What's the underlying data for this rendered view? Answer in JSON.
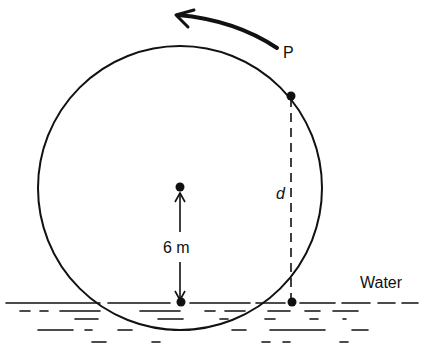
{
  "diagram": {
    "labels": {
      "point": "P",
      "distance": "d",
      "radius": "6 m",
      "water": "Water"
    },
    "rotation_direction": "counterclockwise",
    "colors": {
      "ink": "#111111",
      "background": "#ffffff"
    }
  }
}
